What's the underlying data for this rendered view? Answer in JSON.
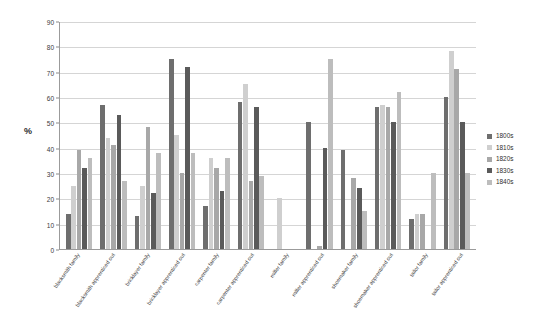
{
  "chart_data": {
    "type": "bar",
    "title": "",
    "subtitle": "",
    "xlabel": "",
    "ylabel": "%",
    "ylim": [
      0,
      90
    ],
    "ytick_step": 10,
    "yticks": [
      0,
      10,
      20,
      30,
      40,
      50,
      60,
      70,
      80,
      90
    ],
    "grid": true,
    "legend_position": "right",
    "categories": [
      "blacksmith family",
      "blacksmith apprenticed out",
      "bricklayer family",
      "bricklayer apprenticed out",
      "carpenter family",
      "carpenter apprenticed out",
      "miller family",
      "miller apprenticed out",
      "shoemaker family",
      "shoemaker apprenticed out",
      "tailor family",
      "tailor apprenticed out"
    ],
    "series": [
      {
        "name": "1800s",
        "color": "#6e6e6e",
        "values": [
          14,
          57,
          13,
          75,
          17,
          58,
          0,
          50,
          39,
          56,
          12,
          60
        ]
      },
      {
        "name": "1810s",
        "color": "#cfcfcf",
        "values": [
          25,
          44,
          25,
          45,
          36,
          65,
          20,
          0,
          0,
          57,
          14,
          78
        ]
      },
      {
        "name": "1820s",
        "color": "#a8a8a8",
        "values": [
          39,
          41,
          48,
          30,
          32,
          27,
          0,
          1,
          28,
          56,
          14,
          71
        ]
      },
      {
        "name": "1830s",
        "color": "#5a5a5a",
        "values": [
          32,
          53,
          22,
          72,
          23,
          56,
          0,
          40,
          24,
          50,
          0,
          50
        ]
      },
      {
        "name": "1840s",
        "color": "#bdbdbd",
        "values": [
          36,
          27,
          38,
          38,
          36,
          29,
          0,
          75,
          15,
          62,
          30,
          30
        ]
      }
    ]
  },
  "legend": {
    "items": [
      {
        "label": "1800s"
      },
      {
        "label": "1810s"
      },
      {
        "label": "1820s"
      },
      {
        "label": "1830s"
      },
      {
        "label": "1840s"
      }
    ]
  }
}
